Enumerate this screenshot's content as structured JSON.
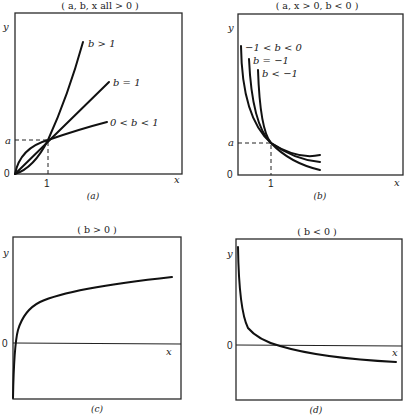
{
  "panels": {
    "a": {
      "title": "( a, b, x all > 0 )",
      "caption": "(a)",
      "y_label": "y",
      "x_label": "x",
      "origin_label": "0",
      "a_tick": "a",
      "one_tick": "1",
      "curve_labels": [
        "b > 1",
        "b = 1",
        "0 < b < 1"
      ]
    },
    "b": {
      "title": "( a, x > 0, b < 0 )",
      "caption": "(b)",
      "y_label": "y",
      "x_label": "x",
      "origin_label": "0",
      "a_tick": "a",
      "one_tick": "1",
      "curve_labels": [
        "−1 < b < 0",
        "b = −1",
        "b < −1"
      ]
    },
    "c": {
      "title": "( b > 0 )",
      "caption": "(c)",
      "y_label": "y",
      "x_label": "x",
      "zero_label": "0"
    },
    "d": {
      "title": "( b < 0 )",
      "caption": "(d)",
      "y_label": "y",
      "x_label": "x",
      "zero_label": "0"
    }
  }
}
